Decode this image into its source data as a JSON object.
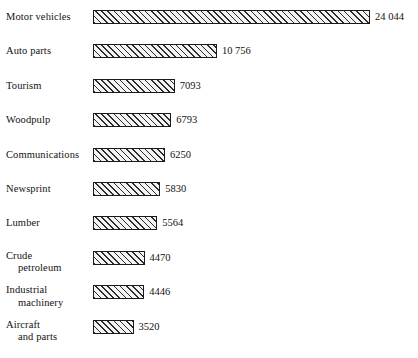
{
  "chart_data": {
    "type": "bar",
    "orientation": "horizontal",
    "title": "",
    "subtitle": "",
    "xlabel": "",
    "ylabel": "",
    "grid": false,
    "legend": null,
    "axis_visible": false,
    "value_label_position": "outside-end",
    "xlim": [
      0,
      24044
    ],
    "categories": [
      "Motor vehicles",
      "Auto parts",
      "Tourism",
      "Woodpulp",
      "Communications",
      "Newsprint",
      "Lumber",
      "Crude petroleum",
      "Industrial machinery",
      "Aircraft and parts"
    ],
    "values": [
      24044,
      10756,
      7093,
      6793,
      6250,
      5830,
      5564,
      4470,
      4446,
      3520
    ],
    "value_labels": [
      "24 044",
      "10 756",
      "7093",
      "6793",
      "6250",
      "5830",
      "5564",
      "4470",
      "4446",
      "3520"
    ]
  },
  "rows": [
    {
      "label_line1": "Motor vehicles",
      "label_line2": "",
      "value": 24044,
      "value_label": "24 044"
    },
    {
      "label_line1": "Auto parts",
      "label_line2": "",
      "value": 10756,
      "value_label": "10 756"
    },
    {
      "label_line1": "Tourism",
      "label_line2": "",
      "value": 7093,
      "value_label": "7093"
    },
    {
      "label_line1": "Woodpulp",
      "label_line2": "",
      "value": 6793,
      "value_label": "6793"
    },
    {
      "label_line1": "Communications",
      "label_line2": "",
      "value": 6250,
      "value_label": "6250"
    },
    {
      "label_line1": "Newsprint",
      "label_line2": "",
      "value": 5830,
      "value_label": "5830"
    },
    {
      "label_line1": "Lumber",
      "label_line2": "",
      "value": 5564,
      "value_label": "5564"
    },
    {
      "label_line1": "Crude",
      "label_line2": "petroleum",
      "value": 4470,
      "value_label": "4470"
    },
    {
      "label_line1": "Industrial",
      "label_line2": "machinery",
      "value": 4446,
      "value_label": "4446"
    },
    {
      "label_line1": "Aircraft",
      "label_line2": "and parts",
      "value": 3520,
      "value_label": "3520"
    }
  ],
  "style": {
    "bar_fill": "#f3f3f3",
    "bar_hatch": "#2b2b2b",
    "bar_border": "#1a1a1a",
    "text_color": "#121212",
    "background": "#ffffff"
  },
  "geometry": {
    "bar_origin_x": 93,
    "px_per_unit": 0.011525,
    "bar_height": 14,
    "row_pitch": 34.4,
    "first_row_top": 10,
    "value_gap": 5
  }
}
